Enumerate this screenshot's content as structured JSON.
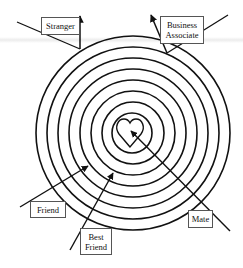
{
  "diagram": {
    "type": "concentric-relationship-target",
    "center": {
      "x": 133,
      "y": 133
    },
    "ring_radii": [
      97,
      86,
      75,
      64,
      53,
      42,
      31,
      20
    ],
    "ring_color": "#111111",
    "center_icon": "heart-icon",
    "labels": [
      {
        "id": "stranger",
        "text": "Stranger"
      },
      {
        "id": "business-associate",
        "text": "Business Associate"
      },
      {
        "id": "friend",
        "text": "Friend"
      },
      {
        "id": "best-friend",
        "text": "Best Friend"
      },
      {
        "id": "mate",
        "text": "Mate"
      }
    ]
  }
}
